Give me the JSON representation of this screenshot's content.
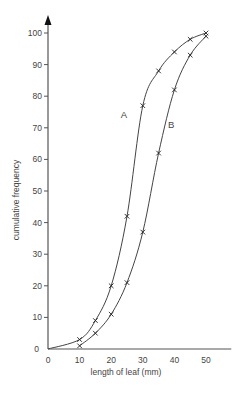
{
  "chart_data": {
    "type": "line",
    "title": "",
    "xlabel": "length of leaf (mm)",
    "ylabel": "cumulative frequency",
    "xlim": [
      0,
      58
    ],
    "ylim": [
      0,
      102
    ],
    "xticks": [
      0,
      10,
      20,
      30,
      40,
      50
    ],
    "yticks": [
      0,
      10,
      20,
      30,
      40,
      50,
      60,
      70,
      80,
      90,
      100
    ],
    "grid": false,
    "legend": "none (curves labelled inline)",
    "marker": "x",
    "series": [
      {
        "name": "A",
        "x": [
          0,
          10,
          15,
          20,
          25,
          30,
          35,
          40,
          45,
          50
        ],
        "values": [
          0,
          3,
          9,
          20,
          42,
          77,
          88,
          94,
          98,
          100
        ],
        "label_at": [
          24,
          73
        ]
      },
      {
        "name": "B",
        "x": [
          10,
          15,
          20,
          25,
          30,
          35,
          40,
          45,
          50
        ],
        "values": [
          1,
          5,
          11,
          21,
          37,
          62,
          82,
          93,
          99
        ],
        "label_at": [
          39,
          70
        ]
      }
    ],
    "annotations": [
      "A",
      "B"
    ]
  },
  "colors": {
    "axis": "#555555",
    "curve": "#444444",
    "text": "#444444",
    "background": "#ffffff"
  }
}
